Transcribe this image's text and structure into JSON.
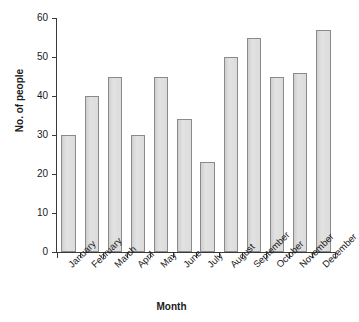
{
  "chart_data": {
    "type": "bar",
    "title": "",
    "xlabel": "Month",
    "ylabel": "No. of people",
    "categories": [
      "January",
      "February",
      "March",
      "April",
      "May",
      "June",
      "July",
      "August",
      "September",
      "October",
      "November",
      "December"
    ],
    "values": [
      30,
      40,
      45,
      30,
      45,
      34,
      23,
      50,
      55,
      45,
      46,
      57
    ],
    "ylim": [
      0,
      60
    ],
    "yticks": [
      0,
      10,
      20,
      30,
      40,
      50,
      60
    ],
    "ytick_labels": [
      "0",
      "10",
      "20",
      "30",
      "40",
      "50",
      "60"
    ],
    "grid": false,
    "legend": false,
    "bar_fill": "#d9d9d9",
    "bar_edge": "#8a8a8a",
    "axis_color": "#3a3a3a",
    "background": "#ffffff"
  }
}
